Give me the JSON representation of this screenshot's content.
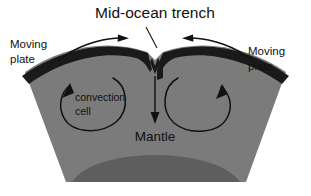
{
  "diagram": {
    "title": "Mid-ocean trench",
    "labels": {
      "moving_plate_left_line1": "Moving",
      "moving_plate_left_line2": "plate",
      "moving_plate_right_line1": "Moving",
      "moving_plate_right_line2": "plate",
      "convection_line1": "convection",
      "convection_line2": "cell",
      "mantle": "Mantle"
    },
    "colors": {
      "background": "#ffffff",
      "crust": "#1a1a1a",
      "upper_mantle": "#7b7b7b",
      "deep_mantle": "#5e5e5e",
      "ink": "#111111"
    },
    "annotations": {
      "leader_line": "title-to-trench-pointer",
      "left_plate_arrow": "arrow-right-toward-trench",
      "right_plate_arrow": "arrow-left-toward-trench",
      "downwelling_arrow": "arrow-down-into-mantle",
      "left_cell_arrow": "counterclockwise-loop",
      "right_cell_arrow": "clockwise-loop"
    }
  }
}
